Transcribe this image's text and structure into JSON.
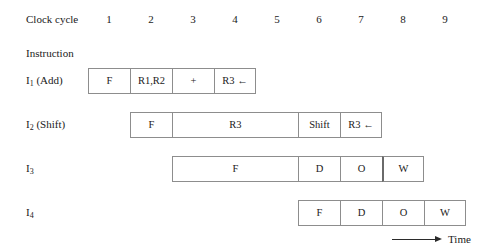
{
  "header": {
    "clock_cycle_label": "Clock cycle",
    "instruction_label": "Instruction",
    "cycles": [
      "1",
      "2",
      "3",
      "4",
      "5",
      "6",
      "7",
      "8",
      "9"
    ]
  },
  "axis": {
    "time_label": "Time",
    "arrow_icon": "right-arrow-icon"
  },
  "grid": {
    "origin_x": 88,
    "cycle_width": 42,
    "total_cycles": 9
  },
  "rows": [
    {
      "id": "i1",
      "label_main": "I",
      "label_sub": "1",
      "label_suffix": " (Add)",
      "label_full": "I1 (Add)",
      "start_cycle": 1,
      "top": 68,
      "cells": [
        {
          "text": "F",
          "span": 1,
          "thick_left": false
        },
        {
          "text": "R1,R2",
          "span": 1,
          "thick_left": false
        },
        {
          "text": "+",
          "span": 1,
          "thick_left": false
        },
        {
          "text": "R3 ←",
          "span": 1,
          "thick_left": false
        }
      ]
    },
    {
      "id": "i2",
      "label_main": "I",
      "label_sub": "2",
      "label_suffix": " (Shift)",
      "label_full": "I2 (Shift)",
      "start_cycle": 2,
      "top": 112,
      "cells": [
        {
          "text": "F",
          "span": 1,
          "thick_left": false
        },
        {
          "text": "R3",
          "span": 3,
          "thick_left": false
        },
        {
          "text": "Shift",
          "span": 1,
          "thick_left": false
        },
        {
          "text": "R3 ←",
          "span": 1,
          "thick_left": false
        }
      ]
    },
    {
      "id": "i3",
      "label_main": "I",
      "label_sub": "3",
      "label_suffix": "",
      "label_full": "I3",
      "start_cycle": 3,
      "top": 156,
      "cells": [
        {
          "text": "F",
          "span": 3,
          "thick_left": false
        },
        {
          "text": "D",
          "span": 1,
          "thick_left": false
        },
        {
          "text": "O",
          "span": 1,
          "thick_left": false
        },
        {
          "text": "W",
          "span": 1,
          "thick_left": true
        }
      ]
    },
    {
      "id": "i4",
      "label_main": "I",
      "label_sub": "4",
      "label_suffix": "",
      "label_full": "I4",
      "start_cycle": 6,
      "top": 200,
      "cells": [
        {
          "text": "F",
          "span": 1,
          "thick_left": false
        },
        {
          "text": "D",
          "span": 1,
          "thick_left": false
        },
        {
          "text": "O",
          "span": 1,
          "thick_left": false
        },
        {
          "text": "W",
          "span": 1,
          "thick_left": false
        }
      ]
    }
  ],
  "colors": {
    "cell_border": "#8d8d8d",
    "thick_border": "#6a6a6a",
    "text": "#1a1a1a",
    "background": "#ffffff"
  }
}
